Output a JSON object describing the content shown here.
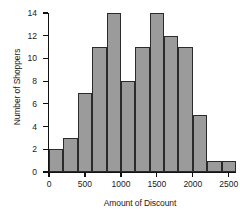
{
  "chart_data": {
    "type": "bar",
    "title": "",
    "xlabel": "Amount of Discount",
    "ylabel": "Number of Shoppers",
    "xlim": [
      0,
      2600
    ],
    "ylim": [
      0,
      14
    ],
    "bin_width": 200,
    "grid": false,
    "legend": null,
    "bar_color": "#9b9b9b",
    "bar_edge_color": "#2b2b2b",
    "axis_color": "#111111",
    "xticks": [
      0,
      500,
      1000,
      1500,
      2000,
      2500
    ],
    "xtick_labels": [
      "0",
      "500",
      "1000",
      "1500",
      "2000",
      "2500"
    ],
    "yticks": [
      0,
      2,
      4,
      6,
      8,
      10,
      12,
      14
    ],
    "ytick_labels": [
      "0",
      "2",
      "4",
      "6",
      "8",
      "10",
      "12",
      "14"
    ],
    "bins": [
      {
        "start": 0,
        "end": 200,
        "value": 2
      },
      {
        "start": 200,
        "end": 400,
        "value": 3
      },
      {
        "start": 400,
        "end": 600,
        "value": 7
      },
      {
        "start": 600,
        "end": 800,
        "value": 11
      },
      {
        "start": 800,
        "end": 1000,
        "value": 14
      },
      {
        "start": 1000,
        "end": 1200,
        "value": 8
      },
      {
        "start": 1200,
        "end": 1400,
        "value": 11
      },
      {
        "start": 1400,
        "end": 1600,
        "value": 14
      },
      {
        "start": 1600,
        "end": 1800,
        "value": 12
      },
      {
        "start": 1800,
        "end": 2000,
        "value": 11
      },
      {
        "start": 2000,
        "end": 2200,
        "value": 5
      },
      {
        "start": 2200,
        "end": 2400,
        "value": 1
      },
      {
        "start": 2400,
        "end": 2600,
        "value": 1
      }
    ],
    "categories": [
      "0-200",
      "200-400",
      "400-600",
      "600-800",
      "800-1000",
      "1000-1200",
      "1200-1400",
      "1400-1600",
      "1600-1800",
      "1800-2000",
      "2000-2200",
      "2200-2400",
      "2400-2600"
    ],
    "values": [
      2,
      3,
      7,
      11,
      14,
      8,
      11,
      14,
      12,
      11,
      5,
      1,
      1
    ]
  }
}
